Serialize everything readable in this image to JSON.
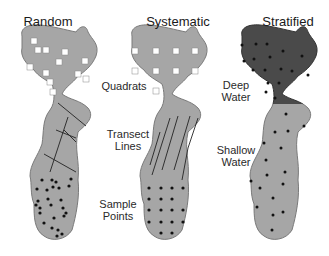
{
  "diagram": {
    "panels": [
      {
        "title": "Random",
        "method": "random"
      },
      {
        "title": "Systematic",
        "method": "systematic"
      },
      {
        "title": "Stratified",
        "method": "stratified"
      }
    ],
    "labels": {
      "quadrats": "Quadrats",
      "transect_1": "Transect",
      "transect_2": "Lines",
      "sample_1": "Sample",
      "sample_2": "Points",
      "deep_1": "Deep",
      "deep_2": "Water",
      "shallow_1": "Shallow",
      "shallow_2": "Water"
    },
    "colors": {
      "lake_fill": "#a6a6a6",
      "deep_fill": "#4a4a4a",
      "outline": "#7a7a7a",
      "marker": "#111111",
      "quadrat": "#ffffff"
    }
  }
}
